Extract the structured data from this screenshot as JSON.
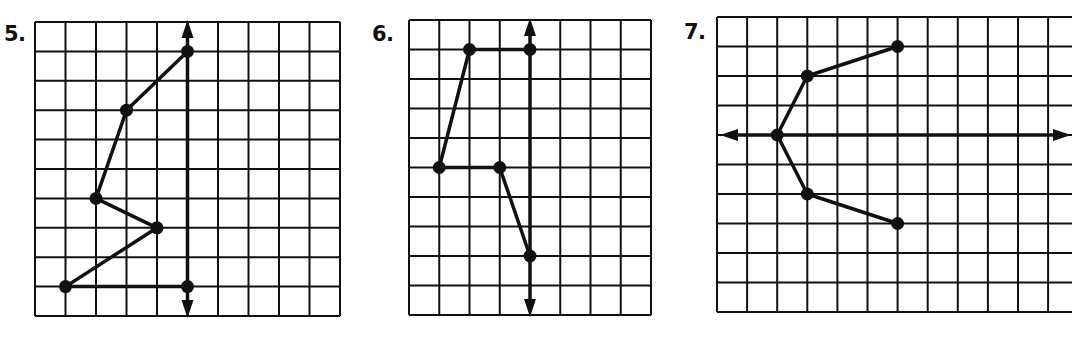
{
  "colors": {
    "ink": "#111111",
    "paper": "#ffffff"
  },
  "problems": [
    {
      "number": "5.",
      "label_pos": [
        4,
        24
      ],
      "grid": {
        "x": 35,
        "y": 22,
        "cols": 10,
        "rows": 10,
        "cw": 30.5,
        "ch": 29.4
      },
      "axis": {
        "orientation": "vertical",
        "index": 5
      },
      "points": [
        [
          5,
          1
        ],
        [
          3,
          3
        ],
        [
          2,
          6
        ],
        [
          4,
          7
        ],
        [
          1,
          9
        ],
        [
          5,
          9
        ]
      ],
      "closed": false
    },
    {
      "number": "6.",
      "label_pos": [
        372,
        24
      ],
      "grid": {
        "x": 409,
        "y": 20,
        "cols": 8,
        "rows": 10,
        "cw": 30.25,
        "ch": 29.5
      },
      "axis": {
        "orientation": "vertical",
        "index": 4
      },
      "points": [
        [
          4,
          1
        ],
        [
          2,
          1
        ],
        [
          1,
          5
        ],
        [
          3,
          5
        ],
        [
          4,
          8
        ]
      ],
      "closed": false
    },
    {
      "number": "7.",
      "label_pos": [
        684,
        22
      ],
      "grid": {
        "x": 717,
        "y": 17,
        "cols": 12,
        "rows": 10,
        "cw": 30.1,
        "ch": 29.5
      },
      "axis": {
        "orientation": "horizontal",
        "index": 4
      },
      "points": [
        [
          6,
          1
        ],
        [
          3,
          2
        ],
        [
          2,
          4
        ],
        [
          3,
          6
        ],
        [
          6,
          7
        ]
      ],
      "closed": false
    }
  ]
}
